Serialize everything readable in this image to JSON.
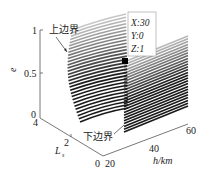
{
  "chart_data": {
    "type": "3d-ribbon",
    "title": "",
    "axes": {
      "z": {
        "label": "e",
        "ticks": [
          "0",
          "0.5",
          "1"
        ],
        "range": [
          0,
          1
        ]
      },
      "y": {
        "label": "L",
        "label_sub": "s",
        "ticks": [
          "4",
          "2",
          "0"
        ],
        "range": [
          0,
          4
        ]
      },
      "x": {
        "label": "h/km",
        "ticks": [
          "20",
          "40",
          "60"
        ],
        "range": [
          20,
          60
        ]
      }
    },
    "annotations": {
      "upper": "上边界",
      "lower": "下边界"
    },
    "datatip": {
      "x_label": "X:30",
      "y_label": "Y:0",
      "z_label": "Z:1",
      "point": {
        "X": 30,
        "Y": 0,
        "Z": 1
      }
    },
    "series_description": "Family of parallel ribbon lines spanning h from ~20 to 60 km, rising in e from lower boundary (e=0 at L=0) to upper boundary (e=1), shaded dark-to-light",
    "line_count": 30,
    "colors": {
      "lines": "#1a1a1a",
      "axes": "#555555",
      "marker": "#000000"
    }
  }
}
